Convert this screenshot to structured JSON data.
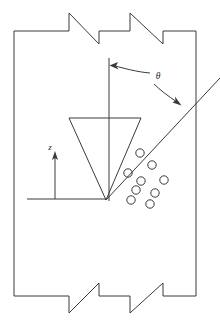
{
  "figure": {
    "background_color": "#ffffff",
    "line_color": "#3a3a3a",
    "text_color": "#2b2b2b",
    "width": 220,
    "height": 327
  },
  "labels": {
    "theta": "θ",
    "axis_z": "z"
  },
  "annotations": {
    "theta_label_x": 158,
    "theta_label_y": 77,
    "z_label_x": 50,
    "z_label_y": 148
  },
  "geometry": {
    "chamber": {
      "left_wall_x": 14,
      "right_wall_x": 196,
      "top_wall_y": 31,
      "bottom_wall_y": 296,
      "top_break_path": "M 14 31 L 69 31 L 69 13 L 99 44 L 99 31 L 130 31 L 130 13 L 163 44 L 163 31 L 196 31",
      "bottom_break_path": "M 14 296 L 69 296 L 69 313 L 99 283 L 99 296 L 130 296 L 130 313 L 163 283 L 163 296 L 196 296",
      "left_wall_path": "M 14 31 L 14 296",
      "right_wall_path": "M 196 31 L 196 296"
    },
    "vertical_axis": {
      "path": "M 109 58 L 109 201",
      "x": 109,
      "top_y": 58,
      "bottom_y": 201
    },
    "cone": {
      "apex_x": 106,
      "apex_y": 200,
      "top_left_x": 69,
      "top_right_x": 141,
      "top_y": 118,
      "path": "M 69 118 L 141 118 L 106 200 Z"
    },
    "diagonal_ray": {
      "start_x": 106,
      "start_y": 200,
      "end_x": 220,
      "end_y": 78,
      "path": "M 106 200 L 220 78"
    },
    "z_axis_arrow": {
      "baseline_path": "M 27 199 L 106 199",
      "shaft_path": "M 55 199 L 55 158",
      "arrow_tip_x": 55,
      "arrow_tip_y": 152
    },
    "theta_arc_left": {
      "path": "M 150 73 C 137 72 123 68 115 66",
      "arrow_tip_x": 110,
      "arrow_tip_y": 65.5
    },
    "theta_arc_right": {
      "path": "M 154 84 C 160 90 168 96 177 102",
      "arrow_tip_x": 181,
      "arrow_tip_y": 105
    }
  },
  "particles": {
    "radius": 4.2,
    "count": 9,
    "positions": [
      {
        "cx": 140,
        "cy": 153
      },
      {
        "cx": 152,
        "cy": 165
      },
      {
        "cx": 128,
        "cy": 173
      },
      {
        "cx": 141,
        "cy": 181
      },
      {
        "cx": 164,
        "cy": 180
      },
      {
        "cx": 136,
        "cy": 190
      },
      {
        "cx": 155,
        "cy": 193
      },
      {
        "cx": 131,
        "cy": 200
      },
      {
        "cx": 150,
        "cy": 204
      }
    ]
  }
}
